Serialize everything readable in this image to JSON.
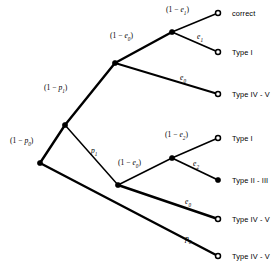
{
  "diagram": {
    "colors": {
      "stroke": "#000000",
      "background": "#ffffff"
    },
    "nodes": [
      {
        "id": "root",
        "name": "root-node",
        "x": 40,
        "y": 163,
        "marker": "filled"
      },
      {
        "id": "n1",
        "name": "branch-node-p1",
        "x": 65,
        "y": 125,
        "marker": "filled"
      },
      {
        "id": "n2",
        "name": "branch-node-e0-upper",
        "x": 115,
        "y": 63,
        "marker": "filled"
      },
      {
        "id": "n3",
        "name": "branch-node-e1",
        "x": 172,
        "y": 32,
        "marker": "filled"
      },
      {
        "id": "n4",
        "name": "branch-node-e0-lower",
        "x": 118,
        "y": 185,
        "marker": "filled"
      },
      {
        "id": "n5",
        "name": "branch-node-e2",
        "x": 172,
        "y": 158,
        "marker": "filled"
      }
    ],
    "leaves": [
      {
        "id": "l1",
        "name": "leaf-correct",
        "x": 218,
        "y": 13,
        "marker": "hollow",
        "label": "correct",
        "label_x": 232,
        "label_y": 10
      },
      {
        "id": "l2",
        "name": "leaf-type-i-upper",
        "x": 218,
        "y": 52,
        "marker": "hollow",
        "label": "Type I",
        "label_x": 232,
        "label_y": 49
      },
      {
        "id": "l3",
        "name": "leaf-type-iv-v-1",
        "x": 218,
        "y": 94,
        "marker": "hollow",
        "label": "Type IV - V",
        "label_x": 232,
        "label_y": 91
      },
      {
        "id": "l4",
        "name": "leaf-type-i-lower",
        "x": 218,
        "y": 138,
        "marker": "hollow",
        "label": "Type I",
        "label_x": 232,
        "label_y": 135
      },
      {
        "id": "l5",
        "name": "leaf-type-ii-iii",
        "x": 218,
        "y": 180,
        "marker": "filled",
        "label": "Type II - III",
        "label_x": 232,
        "label_y": 177
      },
      {
        "id": "l6",
        "name": "leaf-type-iv-v-2",
        "x": 218,
        "y": 219,
        "marker": "hollow",
        "label": "Type IV - V",
        "label_x": 232,
        "label_y": 216
      },
      {
        "id": "l7",
        "name": "leaf-type-iv-v-3",
        "x": 218,
        "y": 256,
        "marker": "hollow",
        "label": "Type IV - V",
        "label_x": 232,
        "label_y": 253
      }
    ],
    "edges": [
      {
        "id": "e_root_n1",
        "name": "edge-1-minus-p0",
        "from": "root",
        "to": "n1",
        "x1": 40,
        "y1": 163,
        "x2": 65,
        "y2": 125,
        "width": 2.4
      },
      {
        "id": "e_root_l7",
        "name": "edge-p0",
        "from": "root",
        "to": "l7",
        "x1": 40,
        "y1": 163,
        "x2": 218,
        "y2": 256,
        "width": 2.4
      },
      {
        "id": "e_n1_n2",
        "name": "edge-1-minus-p1",
        "from": "n1",
        "to": "n2",
        "x1": 65,
        "y1": 125,
        "x2": 115,
        "y2": 63,
        "width": 2.4
      },
      {
        "id": "e_n1_n4",
        "name": "edge-p1",
        "from": "n1",
        "to": "n4",
        "x1": 65,
        "y1": 125,
        "x2": 118,
        "y2": 185,
        "width": 1.5
      },
      {
        "id": "e_n2_n3",
        "name": "edge-1-minus-e0-upper",
        "from": "n2",
        "to": "n3",
        "x1": 115,
        "y1": 63,
        "x2": 172,
        "y2": 32,
        "width": 2.4
      },
      {
        "id": "e_n2_l3",
        "name": "edge-e0-upper",
        "from": "n2",
        "to": "l3",
        "x1": 115,
        "y1": 63,
        "x2": 218,
        "y2": 94,
        "width": 1.9
      },
      {
        "id": "e_n3_l1",
        "name": "edge-1-minus-e1",
        "from": "n3",
        "to": "l1",
        "x1": 172,
        "y1": 32,
        "x2": 218,
        "y2": 13,
        "width": 1.5
      },
      {
        "id": "e_n3_l2",
        "name": "edge-e1",
        "from": "n3",
        "to": "l2",
        "x1": 172,
        "y1": 32,
        "x2": 218,
        "y2": 52,
        "width": 1.9
      },
      {
        "id": "e_n4_n5",
        "name": "edge-1-minus-e0-lower",
        "from": "n4",
        "to": "n5",
        "x1": 118,
        "y1": 185,
        "x2": 172,
        "y2": 158,
        "width": 1.5
      },
      {
        "id": "e_n4_l6",
        "name": "edge-e0-lower",
        "from": "n4",
        "to": "l6",
        "x1": 118,
        "y1": 185,
        "x2": 218,
        "y2": 219,
        "width": 2.4
      },
      {
        "id": "e_n5_l4",
        "name": "edge-1-minus-e2",
        "from": "n5",
        "to": "l4",
        "x1": 172,
        "y1": 158,
        "x2": 218,
        "y2": 138,
        "width": 1.5
      },
      {
        "id": "e_n5_l5",
        "name": "edge-e2",
        "from": "n5",
        "to": "l5",
        "x1": 172,
        "y1": 158,
        "x2": 218,
        "y2": 180,
        "width": 1.9
      }
    ],
    "edge_labels": [
      {
        "id": "lbl_p0n",
        "name": "label-1-minus-p0",
        "pre": "(1 − ",
        "sym": "p",
        "sub": "0",
        "post": ")",
        "x": 10,
        "y": 137
      },
      {
        "id": "lbl_p1n",
        "name": "label-1-minus-p1",
        "pre": "(1 − ",
        "sym": "p",
        "sub": "1",
        "post": ")",
        "x": 44,
        "y": 84
      },
      {
        "id": "lbl_e0un",
        "name": "label-1-minus-e0-upper",
        "pre": "(1 − ",
        "sym": "e",
        "sub": "0",
        "post": ")",
        "x": 110,
        "y": 32
      },
      {
        "id": "lbl_e1n",
        "name": "label-1-minus-e1",
        "pre": "(1 − ",
        "sym": "e",
        "sub": "1",
        "post": ")",
        "x": 166,
        "y": 6
      },
      {
        "id": "lbl_e1",
        "name": "label-e1",
        "pre": "",
        "sym": "e",
        "sub": "1",
        "post": "",
        "x": 197,
        "y": 33
      },
      {
        "id": "lbl_e0u",
        "name": "label-e0-upper",
        "pre": "",
        "sym": "e",
        "sub": "0",
        "post": "",
        "x": 180,
        "y": 74
      },
      {
        "id": "lbl_p1",
        "name": "label-p1",
        "pre": "",
        "sym": "p",
        "sub": "1",
        "post": "",
        "x": 91,
        "y": 147
      },
      {
        "id": "lbl_e2n",
        "name": "label-1-minus-e2",
        "pre": "(1 − ",
        "sym": "e",
        "sub": "2",
        "post": ")",
        "x": 165,
        "y": 131
      },
      {
        "id": "lbl_e0ln",
        "name": "label-1-minus-e0-lower",
        "pre": "(1 − ",
        "sym": "e",
        "sub": "0",
        "post": ")",
        "x": 118,
        "y": 159
      },
      {
        "id": "lbl_e2",
        "name": "label-e2",
        "pre": "",
        "sym": "e",
        "sub": "2",
        "post": "",
        "x": 193,
        "y": 160
      },
      {
        "id": "lbl_e0l",
        "name": "label-e0-lower",
        "pre": "",
        "sym": "e",
        "sub": "0",
        "post": "",
        "x": 185,
        "y": 198
      },
      {
        "id": "lbl_p0",
        "name": "label-p0",
        "pre": "",
        "sym": "p",
        "sub": "0",
        "post": "",
        "x": 185,
        "y": 235
      }
    ]
  }
}
